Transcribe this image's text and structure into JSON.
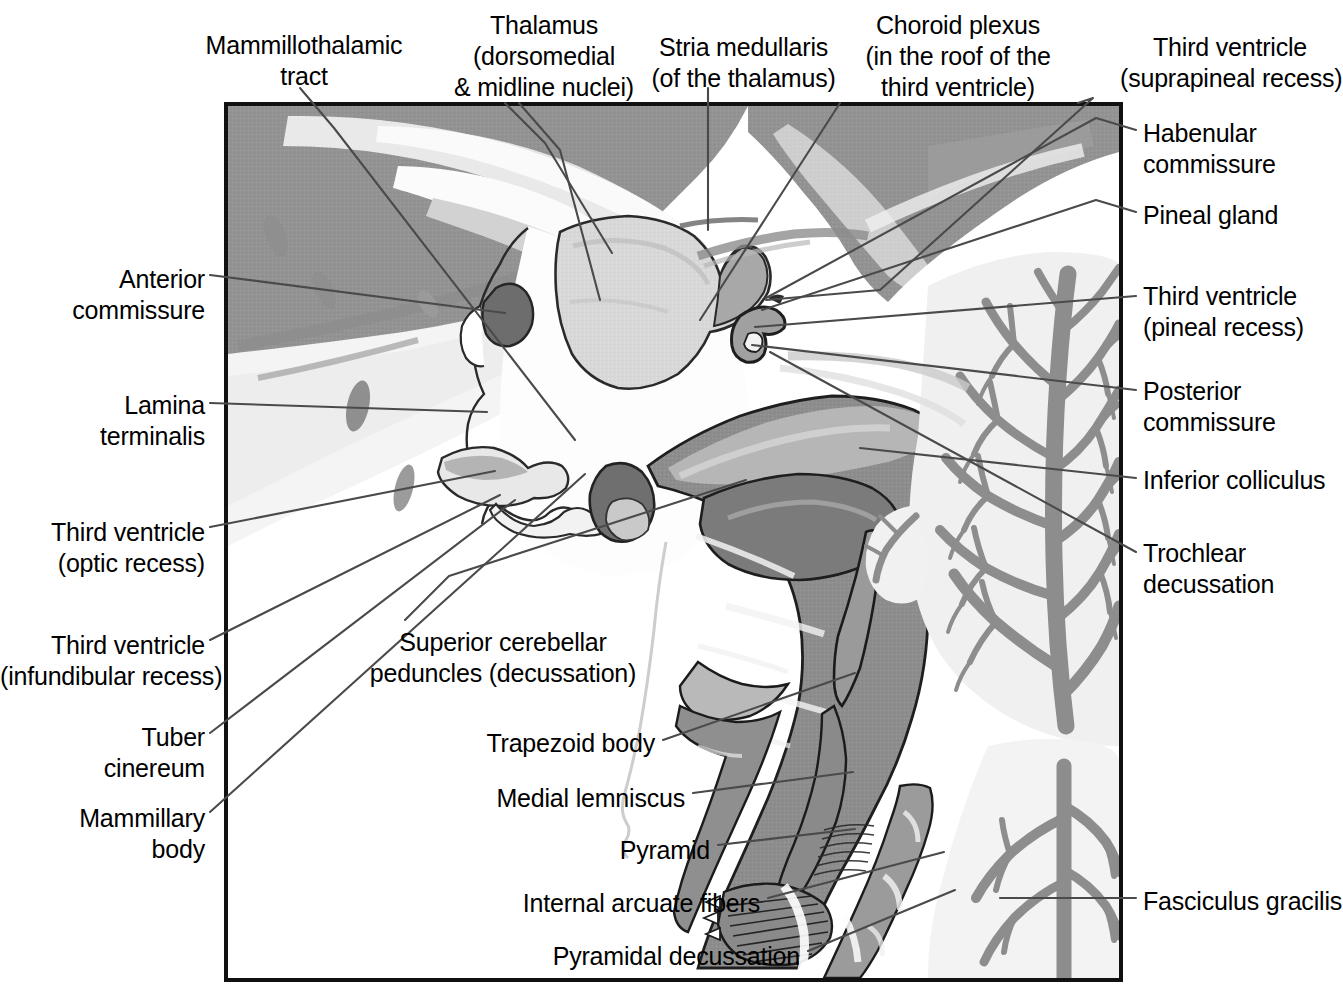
{
  "figure": {
    "type": "anatomical-plate",
    "frame": {
      "x": 224,
      "y": 102,
      "width": 899,
      "height": 880,
      "border_color": "#111111"
    },
    "background_color": "#ffffff",
    "tissue_colors": {
      "gray_matter": "#8d8d8d",
      "white_matter": "#efefef",
      "thalamus_fill": "#d8d8d8",
      "highlight_dark": "#6f6f6f",
      "outline": "#1a1a1a",
      "leader_line": "#4a4a4a"
    }
  },
  "labels": [
    {
      "id": "mammillothalamic-tract",
      "text": "Mammillothalamic\ntract",
      "align": "center",
      "x": 204,
      "y": 30,
      "width": 200
    },
    {
      "id": "thalamus",
      "text": "Thalamus\n(dorsomedial\n& midline nuclei)",
      "align": "center",
      "x": 449,
      "y": 10,
      "width": 190
    },
    {
      "id": "stria-medullaris",
      "text": "Stria medullaris\n(of the thalamus)",
      "align": "center",
      "x": 651,
      "y": 32,
      "width": 185
    },
    {
      "id": "choroid-plexus",
      "text": "Choroid plexus\n(in the roof of the\nthird ventricle)",
      "align": "center",
      "x": 858,
      "y": 10,
      "width": 200
    },
    {
      "id": "third-ventricle-suprapineal",
      "text": "Third ventricle\n(suprapineal recess)",
      "align": "center",
      "x": 1120,
      "y": 32,
      "width": 220
    },
    {
      "id": "habenular-commissure",
      "text": "Habenular\ncommissure",
      "align": "left",
      "x": 1143,
      "y": 118,
      "width": 190
    },
    {
      "id": "pineal-gland",
      "text": "Pineal gland",
      "align": "left",
      "x": 1143,
      "y": 200,
      "width": 190
    },
    {
      "id": "third-ventricle-pineal",
      "text": "Third ventricle\n(pineal recess)",
      "align": "left",
      "x": 1143,
      "y": 281,
      "width": 190
    },
    {
      "id": "posterior-commissure",
      "text": "Posterior\ncommissure",
      "align": "left",
      "x": 1143,
      "y": 376,
      "width": 190
    },
    {
      "id": "inferior-colliculus",
      "text": "Inferior colliculus",
      "align": "left",
      "x": 1143,
      "y": 465,
      "width": 190
    },
    {
      "id": "trochlear-decussation",
      "text": "Trochlear\ndecussation",
      "align": "left",
      "x": 1143,
      "y": 538,
      "width": 190
    },
    {
      "id": "fasciculus-gracilis",
      "text": "Fasciculus gracilis",
      "align": "left",
      "x": 1143,
      "y": 886,
      "width": 190
    },
    {
      "id": "anterior-commissure",
      "text": "Anterior\ncommissure",
      "align": "right",
      "x": 5,
      "y": 264,
      "width": 200
    },
    {
      "id": "lamina-terminalis",
      "text": "Lamina\nterminalis",
      "align": "right",
      "x": 5,
      "y": 390,
      "width": 200
    },
    {
      "id": "third-ventricle-optic",
      "text": "Third ventricle\n(optic recess)",
      "align": "right",
      "x": 5,
      "y": 517,
      "width": 200
    },
    {
      "id": "third-ventricle-infundibular",
      "text": "Third ventricle\n(infundibular recess)",
      "align": "right",
      "x": 0,
      "y": 630,
      "width": 205
    },
    {
      "id": "tuber-cinereum",
      "text": "Tuber\ncinereum",
      "align": "right",
      "x": 5,
      "y": 722,
      "width": 200
    },
    {
      "id": "mammillary-body",
      "text": "Mammillary\nbody",
      "align": "right",
      "x": 5,
      "y": 803,
      "width": 200
    },
    {
      "id": "superior-cerebellar-peduncles",
      "text": "Superior cerebellar\npeduncles (decussation)",
      "align": "center",
      "x": 368,
      "y": 627,
      "width": 270
    },
    {
      "id": "trapezoid-body",
      "text": "Trapezoid body",
      "align": "right",
      "x": 330,
      "y": 728,
      "width": 325
    },
    {
      "id": "medial-lemniscus",
      "text": "Medial lemniscus",
      "align": "right",
      "x": 330,
      "y": 783,
      "width": 355
    },
    {
      "id": "pyramid",
      "text": "Pyramid",
      "align": "right",
      "x": 330,
      "y": 835,
      "width": 380
    },
    {
      "id": "internal-arcuate-fibers",
      "text": "Internal arcuate fibers",
      "align": "right",
      "x": 330,
      "y": 888,
      "width": 430
    },
    {
      "id": "pyramidal-decussation",
      "text": "Pyramidal decussation",
      "align": "right",
      "x": 330,
      "y": 941,
      "width": 470
    }
  ],
  "leader_lines": [
    {
      "id": "leader-mammillothalamic-tract",
      "points": "300,88 334,128 575,440"
    },
    {
      "id": "leader-thalamus-a",
      "points": "505,103 545,143 612,253"
    },
    {
      "id": "leader-thalamus-b",
      "points": "519,103 560,150 600,300"
    },
    {
      "id": "leader-stria-medullaris",
      "points": "708,88 708,230"
    },
    {
      "id": "leader-choroid-plexus",
      "points": "840,103 700,320"
    },
    {
      "id": "leader-third-ventricle-suprapineal",
      "points": "1078,103 1093,98 880,290 766,300"
    },
    {
      "id": "leader-habenular-commissure",
      "points": "1136,130 1096,118 766,298"
    },
    {
      "id": "leader-pineal-gland",
      "points": "1136,212 1096,200 762,310"
    },
    {
      "id": "leader-third-ventricle-pineal",
      "points": "1136,296 755,327"
    },
    {
      "id": "leader-posterior-commissure",
      "points": "1136,390 752,345"
    },
    {
      "id": "leader-inferior-colliculus",
      "points": "1136,478 860,448"
    },
    {
      "id": "leader-trochlear-decussation",
      "points": "1136,552 770,352"
    },
    {
      "id": "leader-fasciculus-gracilis",
      "points": "1136,898 1000,898"
    },
    {
      "id": "leader-anterior-commissure",
      "points": "210,275 505,313"
    },
    {
      "id": "leader-lamina-terminalis",
      "points": "210,403 487,412"
    },
    {
      "id": "leader-third-ventricle-optic",
      "points": "210,527 495,471"
    },
    {
      "id": "leader-third-ventricle-infundibular",
      "points": "210,640 500,495"
    },
    {
      "id": "leader-tuber-cinereum",
      "points": "210,733 515,500"
    },
    {
      "id": "leader-mammillary-body",
      "points": "210,812 585,474"
    },
    {
      "id": "leader-superior-cerebellar-peduncles",
      "points": "405,620 449,576 746,480"
    },
    {
      "id": "leader-trapezoid-body",
      "points": "663,740 855,673"
    },
    {
      "id": "leader-medial-lemniscus",
      "points": "693,793 853,772"
    },
    {
      "id": "leader-pyramid",
      "points": "718,845 855,829"
    },
    {
      "id": "leader-internal-arcuate-fibers",
      "points": "768,898 944,852"
    },
    {
      "id": "leader-pyramidal-decussation",
      "points": "808,951 955,890"
    }
  ]
}
